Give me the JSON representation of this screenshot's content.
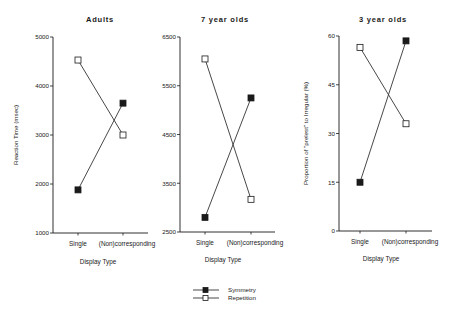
{
  "chart_data": [
    {
      "type": "line",
      "title": "Adults",
      "xlabel": "Display Type",
      "ylabel": "Reaction Time (msec)",
      "categories": [
        "Single",
        "(Non)corresponding"
      ],
      "yticks": [
        1000,
        2000,
        3000,
        4000,
        5000
      ],
      "ylim": [
        1000,
        5000
      ],
      "series": [
        {
          "name": "Symmetry",
          "marker": "filled-square",
          "values": [
            1880,
            3650
          ]
        },
        {
          "name": "Repetition",
          "marker": "open-square",
          "values": [
            4530,
            3000
          ]
        }
      ]
    },
    {
      "type": "line",
      "title": "7 year olds",
      "xlabel": "Display Type",
      "ylabel": "",
      "categories": [
        "Single",
        "(Non)corresponding"
      ],
      "yticks": [
        2500,
        3500,
        4500,
        5500,
        6500
      ],
      "ylim": [
        2500,
        6500
      ],
      "series": [
        {
          "name": "Symmetry",
          "marker": "filled-square",
          "values": [
            2800,
            5250
          ]
        },
        {
          "name": "Repetition",
          "marker": "open-square",
          "values": [
            6050,
            3170
          ]
        }
      ]
    },
    {
      "type": "line",
      "title": "3 year olds",
      "xlabel": "Display Type",
      "ylabel": "Proportion of \"prelest\" to Irregular (%)",
      "categories": [
        "Single",
        "(Non)corresponding"
      ],
      "yticks": [
        0,
        15,
        30,
        45,
        60
      ],
      "ylim": [
        0,
        60
      ],
      "series": [
        {
          "name": "Symmetry",
          "marker": "filled-square",
          "values": [
            15,
            58.5
          ]
        },
        {
          "name": "Repetition",
          "marker": "open-square",
          "values": [
            56.5,
            33
          ]
        }
      ]
    }
  ],
  "legend": {
    "position": "bottom-center",
    "items": [
      {
        "label": "Symmetry",
        "marker": "filled-square"
      },
      {
        "label": "Repetition",
        "marker": "open-square"
      }
    ]
  },
  "colors": {
    "ink": "#1a1a1a",
    "background": "#ffffff"
  }
}
